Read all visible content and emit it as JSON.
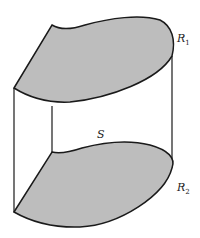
{
  "diagram": {
    "labels": {
      "top_region": "R",
      "top_region_sub": "1",
      "bottom_region": "R",
      "bottom_region_sub": "2",
      "surface": "S"
    },
    "colors": {
      "region_fill": "#bdbdbd",
      "stroke": "#1a1a1a",
      "background": "#ffffff"
    }
  }
}
